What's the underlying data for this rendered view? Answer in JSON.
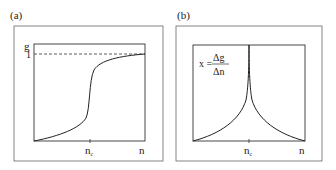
{
  "panels": [
    {
      "id": "a",
      "label": "(a)",
      "y_axis_label": "g",
      "y_tick": "1",
      "x_tick_main": "n",
      "x_tick_sub": "c",
      "x_axis_label": "n",
      "curve": "sigmoid rising from 0 to 1 with steep step at n_c",
      "reference_line": "dashed line at g = 1"
    },
    {
      "id": "b",
      "label": "(b)",
      "formula_lhs": "x =",
      "formula_num": "Δg",
      "formula_den": "Δn",
      "x_tick_main": "n",
      "x_tick_sub": "c",
      "x_axis_label": "n",
      "curve": "cusp peak diverging at n_c"
    }
  ],
  "colors": {
    "line": "#222222",
    "frame": "#555555",
    "background": "#ffffff"
  }
}
